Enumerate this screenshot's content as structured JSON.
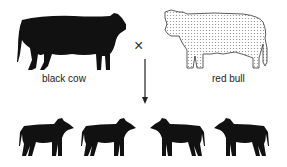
{
  "diagram": {
    "parents": [
      {
        "label": "black cow",
        "color": "#111111",
        "pattern": "solid"
      },
      {
        "label": "red bull",
        "color": "#dcdcdc",
        "pattern": "stippled"
      }
    ],
    "cross_symbol": "×",
    "offspring": [
      {
        "color": "#111111",
        "facing": "right"
      },
      {
        "color": "#111111",
        "facing": "right"
      },
      {
        "color": "#111111",
        "facing": "left"
      },
      {
        "color": "#111111",
        "facing": "left"
      }
    ],
    "offspring_count": 4
  }
}
